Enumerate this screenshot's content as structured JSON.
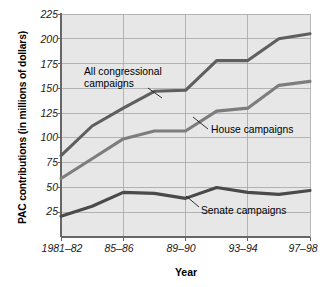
{
  "chart_data": {
    "type": "line",
    "title": "",
    "xlabel": "Year",
    "ylabel": "PAC contributions (in millions of dollars)",
    "xlim": [
      0,
      8
    ],
    "ylim": [
      0,
      225
    ],
    "yticks": [
      25,
      50,
      75,
      100,
      125,
      150,
      175,
      200,
      225
    ],
    "ytick_labels": [
      "25",
      "50",
      "75",
      "100",
      "125",
      "150",
      "175",
      "200",
      "225"
    ],
    "grid": true,
    "legend_position": "inline-annotations",
    "categories": [
      "1981-82",
      "83-84",
      "85-86",
      "87-88",
      "89-90",
      "91-92",
      "93-94",
      "95-96",
      "97-98"
    ],
    "xtick_labels": [
      "1981–82",
      "85–86",
      "89–90",
      "93–94",
      "97–98"
    ],
    "xtick_label_indices": [
      0,
      2,
      4,
      6,
      8
    ],
    "series": [
      {
        "name": "All congressional campaigns",
        "color": "#5f5f5f",
        "values": [
          82,
          112,
          130,
          147,
          148,
          178,
          178,
          200,
          205
        ]
      },
      {
        "name": "House campaigns",
        "color": "#7d7d7d",
        "values": [
          59,
          79,
          99,
          107,
          107,
          127,
          130,
          153,
          157
        ]
      },
      {
        "name": "Senate campaigns",
        "color": "#4a4a4a",
        "values": [
          21,
          31,
          45,
          44,
          39,
          50,
          45,
          43,
          47
        ]
      }
    ],
    "annotations": [
      {
        "name": "all-congressional-label",
        "text_line1": "All congressional",
        "text_line2": "campaigns"
      },
      {
        "name": "house-label",
        "text": "House campaigns"
      },
      {
        "name": "senate-label",
        "text": "Senate campaigns"
      }
    ]
  },
  "axis": {
    "y_title": "PAC contributions (in millions of dollars)",
    "x_title": "Year",
    "y_labels": [
      "225",
      "200",
      "175",
      "150",
      "125",
      "100",
      "75",
      "50",
      "25"
    ],
    "x_labels": [
      "1981–82",
      "85–86",
      "89–90",
      "93–94",
      "97–98"
    ]
  },
  "annotations": {
    "all_congressional_l1": "All congressional",
    "all_congressional_l2": "campaigns",
    "house": "House campaigns",
    "senate": "Senate campaigns"
  },
  "colors": {
    "plot_background": "#e7e7e7",
    "grid": "#a6a6a6",
    "axis": "#777777",
    "series_all": "#5f5f5f",
    "series_house": "#7d7d7d",
    "series_senate": "#4a4a4a",
    "text": "#000000"
  }
}
